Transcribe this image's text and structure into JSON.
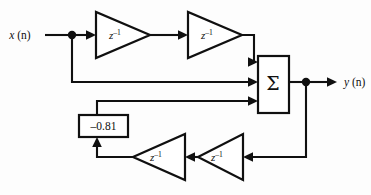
{
  "diagram": {
    "background_color": "#fdfdfd",
    "line_color": "#101010",
    "labels": {
      "input_var": "x",
      "input_arg": " (n)",
      "output_var": "y",
      "output_arg": " (n)",
      "summation_symbol": "Σ",
      "coefficient": "–0.81",
      "delay_base": "z",
      "delay_exponent": "–1"
    },
    "blocks": [
      {
        "id": "delay-top-1",
        "kind": "delay",
        "label_base": "z",
        "label_exponent": "–1",
        "direction": "right"
      },
      {
        "id": "delay-top-2",
        "kind": "delay",
        "label_base": "z",
        "label_exponent": "–1",
        "direction": "right"
      },
      {
        "id": "summer",
        "kind": "summer",
        "label": "Σ",
        "inputs": 3,
        "outputs": 1
      },
      {
        "id": "gain",
        "kind": "gain",
        "label": "–0.81"
      },
      {
        "id": "delay-bottom-left",
        "kind": "delay",
        "label_base": "z",
        "label_exponent": "–1",
        "direction": "left"
      },
      {
        "id": "delay-bottom-right",
        "kind": "delay",
        "label_base": "z",
        "label_exponent": "–1",
        "direction": "left"
      }
    ],
    "nodes": [
      {
        "id": "input-junction",
        "x": 72,
        "y": 35
      },
      {
        "id": "output-junction",
        "x": 306,
        "y": 82
      }
    ]
  }
}
